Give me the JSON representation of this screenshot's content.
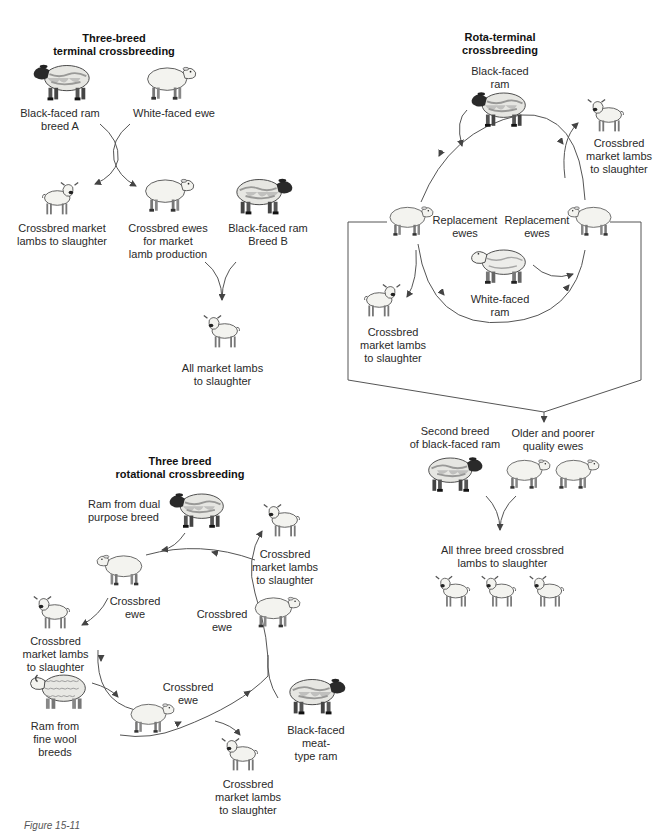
{
  "panels": {
    "terminal": {
      "title": "Three-breed\nterminal crossbreeding",
      "labels": {
        "ram_a": "Black-faced ram\nbreed A",
        "ewe": "White-faced ewe",
        "lambs1": "Crossbred market\nlambs to slaughter",
        "crossbred_ewes": "Crossbred ewes\nfor market\nlamb production",
        "ram_b": "Black-faced ram\nBreed B",
        "all_lambs": "All market lambs\nto slaughter"
      }
    },
    "rota_terminal": {
      "title": "Rota-terminal\ncrossbreeding",
      "labels": {
        "bf_ram": "Black-faced\nram",
        "lambs_right": "Crossbred\nmarket lambs\nto slaughter",
        "repl_left": "Replacement\newes",
        "repl_right": "Replacement\newes",
        "wf_ram": "White-faced\nram",
        "lambs_left": "Crossbred\nmarket lambs\nto slaughter",
        "second_breed": "Second breed\nof black-faced ram",
        "older_ewes": "Older and poorer\nquality ewes",
        "all_three": "All three breed crossbred\nlambs to slaughter"
      }
    },
    "rotational": {
      "title": "Three breed\nrotational crossbreeding",
      "labels": {
        "dual_ram": "Ram from dual\npurpose breed",
        "lambs_top": "Crossbred market lambs\nto slaughter",
        "ewe_left": "Crossbred\newe",
        "ewe_right": "Crossbred\newe",
        "lambs_left": "Crossbred\nmarket lambs\nto slaughter",
        "fine_wool": "Ram from\nfine wool\nbreeds",
        "ewe_bottom": "Crossbred\newe",
        "meat_ram": "Black-faced\nmeat-\ntype ram",
        "lambs_bottom": "Crossbred\nmarket lambs\nto slaughter"
      }
    }
  },
  "caption": "Figure 15-11",
  "colors": {
    "ink": "#2a2a2a",
    "fleece": "#f2f2ee",
    "dark_fleece": "#8a8a86",
    "line": "#555555"
  }
}
